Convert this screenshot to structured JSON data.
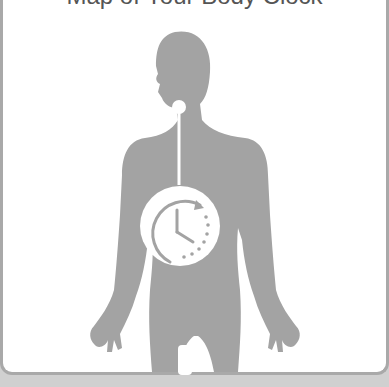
{
  "title": "Map of Your Body Clock",
  "figure": {
    "silhouette_color": "#a3a3a3",
    "frame_border_color": "#a9a9a9",
    "background_color": "#d0d0d0",
    "icons": [
      "human-silhouette",
      "brain-node",
      "clock-cycle-icon"
    ]
  }
}
